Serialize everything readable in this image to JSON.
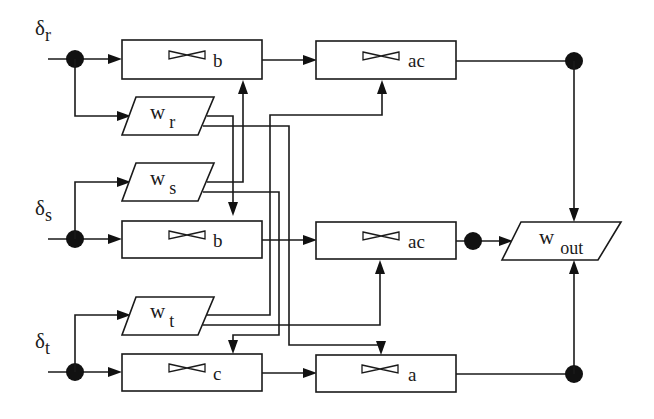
{
  "inputs": [
    {
      "id": "r",
      "symbol": "δ",
      "subscript": "r"
    },
    {
      "id": "s",
      "symbol": "δ",
      "subscript": "s"
    },
    {
      "id": "t",
      "symbol": "δ",
      "subscript": "t"
    }
  ],
  "weights": [
    {
      "id": "wr",
      "symbol": "w",
      "subscript": "r"
    },
    {
      "id": "ws",
      "symbol": "w",
      "subscript": "s"
    },
    {
      "id": "wt",
      "symbol": "w",
      "subscript": "t"
    },
    {
      "id": "wout",
      "symbol": "w",
      "subscript": "out"
    }
  ],
  "filters": [
    {
      "id": "row1-b",
      "label": "b",
      "icon": "bowtie-icon"
    },
    {
      "id": "row1-ac",
      "label": "ac",
      "icon": "bowtie-icon"
    },
    {
      "id": "row2-b",
      "label": "b",
      "icon": "bowtie-icon"
    },
    {
      "id": "row2-ac",
      "label": "ac",
      "icon": "bowtie-icon"
    },
    {
      "id": "row3-c",
      "label": "c",
      "icon": "bowtie-icon"
    },
    {
      "id": "row3-a",
      "label": "a",
      "icon": "bowtie-icon"
    }
  ],
  "colors": {
    "stroke": "#1a1a1a",
    "background": "#ffffff",
    "node": "#111111"
  }
}
